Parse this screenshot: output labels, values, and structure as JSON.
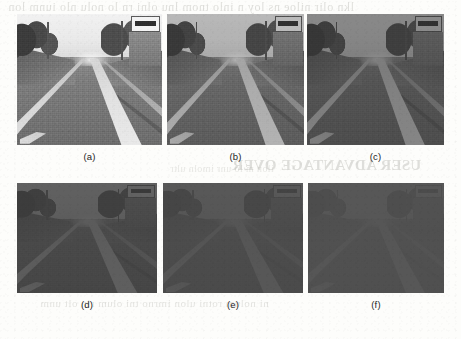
{
  "figure": {
    "type": "image-grid",
    "rows": 2,
    "columns": 3,
    "page_background": "#fdfdfb",
    "caption_color": "#1d1d1d",
    "panels": [
      {
        "id": "a",
        "caption": "(a)",
        "row": 1,
        "column": 1,
        "scene": "road-scene",
        "brightness_label": "brightest",
        "veil_opacity": 0.0,
        "contrast": 1.0,
        "x": 17,
        "y": 14,
        "width": 145,
        "height": 131
      },
      {
        "id": "b",
        "caption": "(b)",
        "row": 1,
        "column": 2,
        "scene": "road-scene",
        "brightness_label": "slightly darkened",
        "veil_opacity": 0.2,
        "contrast": 0.88,
        "x": 167,
        "y": 14,
        "width": 137,
        "height": 131
      },
      {
        "id": "c",
        "caption": "(c)",
        "row": 1,
        "column": 3,
        "scene": "road-scene",
        "brightness_label": "darkened",
        "veil_opacity": 0.42,
        "contrast": 0.78,
        "x": 307,
        "y": 14,
        "width": 137,
        "height": 131
      },
      {
        "id": "d",
        "caption": "(d)",
        "row": 2,
        "column": 1,
        "scene": "road-scene",
        "brightness_label": "very dark",
        "veil_opacity": 0.68,
        "contrast": 0.62,
        "x": 17,
        "y": 183,
        "width": 140,
        "height": 110
      },
      {
        "id": "e",
        "caption": "(e)",
        "row": 2,
        "column": 2,
        "scene": "road-scene",
        "brightness_label": "near black",
        "veil_opacity": 0.8,
        "contrast": 0.5,
        "x": 163,
        "y": 183,
        "width": 140,
        "height": 110
      },
      {
        "id": "f",
        "caption": "(f)",
        "row": 2,
        "column": 3,
        "scene": "road-scene",
        "brightness_label": "darkest",
        "veil_opacity": 0.87,
        "contrast": 0.42,
        "x": 308,
        "y": 183,
        "width": 136,
        "height": 110
      }
    ],
    "scene_elements": {
      "sky": "overcast sky band across upper portion",
      "road": "asphalt roadway receding to vanishing point",
      "lane_centre": "bright painted centre lane marking",
      "lane_left": "left edge lane marking",
      "lane_right": "right edge lane marking",
      "trees_left": "row of trees along left verge",
      "trees_right": "trees and foliage along right verge",
      "building_right": "building facade on right side",
      "billboard": "rectangular billboard sign upper right",
      "pole_left": "utility pole on left",
      "pole_right": "utility pole on right",
      "shoulder_stripe": "painted marking on lower left shoulder"
    }
  },
  "bleed_through": {
    "note": "Faint mirrored ghost text showing through from the reverse side of the scanned page.",
    "top_line": "lkn olir  niloe ns  loy   n inlo tnom lnu  olni  rn  lo nolu nlo iunm lon",
    "mid_line": "USER ADVANTAGE OVER",
    "row1_line": "ilon  m  lo  unr  imoln  ultr",
    "low_line": "ni nolum rotni ulon imrno tni  olum rin  olt unm"
  }
}
